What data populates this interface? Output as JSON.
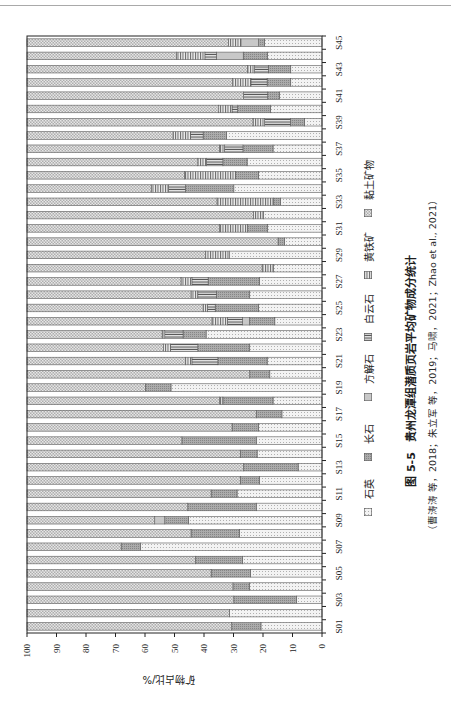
{
  "figure": {
    "caption_number": "图 5-5",
    "caption_title": "贵州龙潭组潜质页岩平均矿物成分统计",
    "citation": "（曹涛涛 等，2018；朱立军 等，2019；马啸，2021；Zhao et al., 2021）",
    "display_rotation": "90° counter-clockwise"
  },
  "chart_data": {
    "type": "bar",
    "stacked": true,
    "title": "",
    "xlabel": "",
    "ylabel": "矿物占比/%",
    "ylim": [
      0,
      100
    ],
    "yticks": [
      0,
      10,
      20,
      30,
      40,
      50,
      60,
      70,
      80,
      90,
      100
    ],
    "grid": false,
    "xtick_label_step": 2,
    "legend_position": "bottom",
    "categories": [
      "S01",
      "S02",
      "S03",
      "S04",
      "S05",
      "S06",
      "S07",
      "S08",
      "S09",
      "S10",
      "S11",
      "S12",
      "S13",
      "S14",
      "S15",
      "S16",
      "S17",
      "S18",
      "S19",
      "S20",
      "S21",
      "S22",
      "S23",
      "S24",
      "S25",
      "S26",
      "S27",
      "S28",
      "S29",
      "S30",
      "S31",
      "S32",
      "S33",
      "S34",
      "S35",
      "S36",
      "S37",
      "S38",
      "S39",
      "S40",
      "S41",
      "S42",
      "S43",
      "S44",
      "S45"
    ],
    "series": [
      {
        "name": "石英",
        "pattern": "fine-dots-light",
        "fill": "#f3f3f3",
        "values": [
          20.7,
          31.4,
          8.7,
          24.6,
          24.3,
          26.9,
          61.6,
          28.0,
          45.2,
          22.3,
          28.8,
          21.2,
          8.1,
          22.0,
          22.3,
          21.5,
          13.6,
          16.6,
          51.2,
          17.7,
          18.6,
          24.5,
          39.3,
          16.0,
          21.5,
          24.5,
          21.2,
          16.4,
          31.3,
          12.7,
          18.4,
          19.8,
          14.1,
          29.9,
          21.5,
          25.4,
          16.6,
          32.4,
          6.0,
          17.4,
          14.4,
          10.6,
          10.6,
          18.5,
          19.5
        ]
      },
      {
        "name": "长石",
        "pattern": "fine-dots-dark",
        "fill": "#ababab",
        "values": [
          9.9,
          0,
          21.2,
          5.6,
          13.3,
          16.0,
          6.5,
          16.4,
          8.1,
          23.2,
          8.8,
          6.5,
          18.5,
          5.7,
          25.2,
          9.0,
          8.7,
          17.0,
          8.7,
          6.8,
          16.7,
          17.6,
          7.8,
          8.6,
          14.7,
          11.3,
          17.4,
          0,
          0,
          2.2,
          6.8,
          0,
          2.3,
          16.4,
          7.9,
          8.2,
          10.2,
          7.9,
          4.7,
          11.2,
          4.0,
          8.0,
          7.6,
          8.2,
          2.0
        ]
      },
      {
        "name": "方解石",
        "pattern": "solid",
        "fill": "#c8c8c8",
        "values": [
          0,
          0,
          0,
          0,
          0,
          0,
          0,
          0,
          3.4,
          0,
          0,
          0,
          0,
          0,
          0,
          0,
          0,
          0,
          0,
          0,
          0,
          0,
          0,
          2.3,
          0,
          0,
          0,
          0,
          0,
          0,
          0,
          0,
          0,
          0,
          0,
          0,
          0,
          0,
          0,
          0,
          0,
          0,
          0,
          9.1,
          6.0
        ]
      },
      {
        "name": "白云石",
        "pattern": "vertical-lines",
        "fill": "#e4e4e4",
        "values": [
          0,
          0,
          0,
          0,
          0,
          0,
          0,
          0,
          0,
          0,
          0,
          0,
          0,
          0,
          0,
          0,
          0,
          0,
          0,
          0,
          8.8,
          9.3,
          6.2,
          5.1,
          2.6,
          6.3,
          5.5,
          0,
          0,
          0,
          0,
          0,
          0,
          5.7,
          0,
          5.6,
          6.3,
          4.3,
          8.8,
          1.9,
          8.2,
          5.5,
          4.7,
          3.9,
          0
        ]
      },
      {
        "name": "黄铁矿",
        "pattern": "horizontal-lines",
        "fill": "#ededed",
        "values": [
          0,
          0,
          0,
          0,
          0,
          0,
          0,
          0,
          0,
          0,
          0,
          0,
          0,
          0,
          0,
          0,
          0,
          1.1,
          0,
          0,
          2.2,
          2.3,
          0.9,
          5.3,
          1.5,
          2.3,
          3.7,
          3.9,
          8.2,
          0,
          9.5,
          3.4,
          19.2,
          5.9,
          17.2,
          2.9,
          1.7,
          5.9,
          3.9,
          4.5,
          0,
          6.2,
          2.4,
          9.6,
          4.2
        ]
      },
      {
        "name": "黏土矿物",
        "pattern": "checker",
        "fill": "#e6e6e6",
        "values": [
          69.4,
          68.6,
          70.1,
          69.8,
          62.4,
          57.1,
          31.9,
          55.6,
          43.3,
          54.5,
          62.4,
          72.3,
          73.4,
          72.3,
          52.5,
          69.5,
          77.7,
          65.3,
          40.1,
          75.5,
          53.7,
          46.3,
          45.8,
          62.7,
          59.7,
          55.6,
          52.2,
          79.7,
          60.5,
          85.1,
          65.3,
          76.8,
          64.4,
          42.1,
          53.4,
          57.9,
          65.2,
          49.5,
          76.6,
          65.0,
          73.4,
          69.7,
          74.7,
          50.7,
          68.3
        ]
      }
    ],
    "colors": {
      "axis": "#222222",
      "segment_outline": "#5a5a5a",
      "page_edge_line": "#a9a9a9"
    }
  }
}
